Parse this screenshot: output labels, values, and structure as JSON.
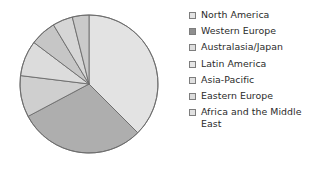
{
  "chart_data": {
    "type": "pie",
    "title": "",
    "legend_position": "right",
    "start_angle_deg": 0,
    "direction": "clockwise",
    "categories": [
      "North America",
      "Western Europe",
      "Australasia/Japan",
      "Latin America",
      "Asia-Pacific",
      "Eastern Europe",
      "Africa and the Middle East"
    ],
    "values": [
      37.5,
      29.7,
      9.7,
      8.3,
      6.1,
      4.7,
      4.0
    ],
    "value_unit": "percent",
    "colors": [
      "#e3e3e3",
      "#aeaeae",
      "#cfcfcf",
      "#dcdcdc",
      "#c6c6c6",
      "#d6d6d6",
      "#cacaca"
    ],
    "slice_angles_deg": [
      {
        "name": "North America",
        "start": 0,
        "end": 135
      },
      {
        "name": "Western Europe",
        "start": 135,
        "end": 242
      },
      {
        "name": "Australasia/Japan",
        "start": 242,
        "end": 277
      },
      {
        "name": "Latin America",
        "start": 277,
        "end": 307
      },
      {
        "name": "Asia-Pacific",
        "start": 307,
        "end": 329
      },
      {
        "name": "Eastern Europe",
        "start": 329,
        "end": 346
      },
      {
        "name": "Africa and the Middle East",
        "start": 346,
        "end": 360
      }
    ],
    "stroke_color": "#6b6b6b",
    "xlabel": "",
    "ylabel": ""
  },
  "pie": {
    "center_x": 89,
    "center_y": 84,
    "radius": 69
  },
  "legend": {
    "items": [
      {
        "label": "North America",
        "swatch": "#e3e3e3",
        "icon": "legend-swatch-icon"
      },
      {
        "label": "Western Europe",
        "swatch": "#8f8f8f",
        "icon": "legend-swatch-icon"
      },
      {
        "label": "Australasia/Japan",
        "swatch": "#dedede",
        "icon": "legend-swatch-icon"
      },
      {
        "label": "Latin America",
        "swatch": "#e6e6e6",
        "icon": "legend-swatch-icon"
      },
      {
        "label": "Asia-Pacific",
        "swatch": "#e0e0e0",
        "icon": "legend-swatch-icon"
      },
      {
        "label": "Eastern Europe",
        "swatch": "#dcdcdc",
        "icon": "legend-swatch-icon"
      },
      {
        "label": "Africa and the Middle East",
        "swatch": "#e1e1e1",
        "icon": "legend-swatch-icon"
      }
    ]
  }
}
